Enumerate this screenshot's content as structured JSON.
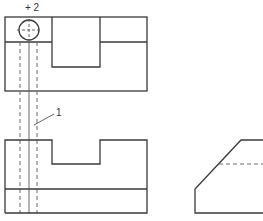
{
  "drawing": {
    "type": "orthographic projection",
    "labels": {
      "top_marker": "+ 2",
      "leader_label": "1"
    },
    "views": [
      "top-view",
      "front-view",
      "side-view"
    ],
    "colors": {
      "line": "#3a3a3a",
      "hidden_line": "#6a6a6a",
      "background": "#ffffff"
    }
  }
}
